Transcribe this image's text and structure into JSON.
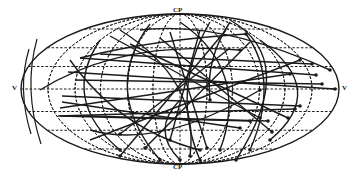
{
  "diagram": {
    "type": "all-sky equal-area projection (Aitoff/Hammer) with trajectory tracks",
    "labels": {
      "top_pole": "CP",
      "bottom_pole": "CP",
      "left_edge": "V",
      "right_edge": "V"
    },
    "geometry": {
      "cx": 180,
      "cy": 89,
      "rx": 159,
      "ry": 75
    },
    "colors": {
      "ink": "#1a1a1a",
      "background": "#ffffff"
    },
    "grid": {
      "meridian_fractions": [
        -0.83,
        -0.66,
        -0.5,
        -0.33,
        -0.17,
        0.17,
        0.33,
        0.5,
        0.66,
        0.83
      ],
      "parallel_fractions": [
        -0.8,
        -0.55,
        -0.3,
        0.3,
        0.55,
        0.8
      ]
    },
    "tracks": [
      {
        "type": "line",
        "pts": [
          [
            62,
            102
          ],
          [
            240,
            128
          ]
        ],
        "end": [
          240,
          128
        ]
      },
      {
        "type": "line",
        "pts": [
          [
            62,
            96
          ],
          [
            300,
            106
          ]
        ],
        "end": [
          300,
          106
        ]
      },
      {
        "type": "line",
        "pts": [
          [
            68,
            72
          ],
          [
            335,
            89
          ]
        ],
        "end": [
          335,
          89
        ]
      },
      {
        "type": "line",
        "pts": [
          [
            60,
            108
          ],
          [
            290,
            74
          ]
        ],
        "end": [
          290,
          74
        ]
      },
      {
        "type": "line",
        "pts": [
          [
            80,
            58
          ],
          [
            316,
            75
          ]
        ],
        "end": [
          316,
          75
        ]
      },
      {
        "type": "line",
        "pts": [
          [
            58,
            116
          ],
          [
            295,
            109
          ]
        ],
        "end": [
          295,
          109
        ]
      },
      {
        "type": "line",
        "pts": [
          [
            86,
            116
          ],
          [
            268,
            121
          ]
        ],
        "end": [
          268,
          121
        ]
      },
      {
        "type": "line",
        "pts": [
          [
            75,
            80
          ],
          [
            322,
            84
          ]
        ],
        "end": [
          322,
          84
        ]
      },
      {
        "type": "line",
        "pts": [
          [
            60,
            116
          ],
          [
            250,
            121
          ]
        ],
        "end": [
          250,
          121
        ]
      },
      {
        "type": "line",
        "pts": [
          [
            100,
            54
          ],
          [
            312,
            64
          ]
        ],
        "end": [
          312,
          64
        ]
      },
      {
        "type": "line",
        "pts": [
          [
            110,
            36
          ],
          [
            260,
            118
          ]
        ],
        "end": [
          260,
          118
        ]
      },
      {
        "type": "line",
        "pts": [
          [
            130,
            44
          ],
          [
            288,
            118
          ]
        ],
        "end": [
          288,
          118
        ]
      },
      {
        "type": "line",
        "pts": [
          [
            226,
            30
          ],
          [
            120,
            156
          ]
        ],
        "end": [
          120,
          156
        ]
      },
      {
        "type": "line",
        "pts": [
          [
            250,
            42
          ],
          [
            145,
            148
          ]
        ],
        "end": [
          145,
          148
        ]
      },
      {
        "type": "line",
        "pts": [
          [
            230,
            48
          ],
          [
            120,
            134
          ]
        ],
        "end": [
          120,
          134
        ]
      },
      {
        "type": "line",
        "pts": [
          [
            160,
            38
          ],
          [
            272,
            132
          ]
        ],
        "end": [
          272,
          132
        ]
      },
      {
        "type": "line",
        "pts": [
          [
            90,
            140
          ],
          [
            300,
            60
          ]
        ],
        "end": [
          300,
          60
        ]
      },
      {
        "type": "line",
        "pts": [
          [
            170,
            32
          ],
          [
            207,
            148
          ]
        ],
        "end": [
          207,
          148
        ]
      },
      {
        "type": "line",
        "pts": [
          [
            200,
            30
          ],
          [
            170,
            140
          ]
        ],
        "end": [
          170,
          140
        ]
      },
      {
        "type": "curve",
        "d": "M80 58 Q150 40 246 34",
        "end": [
          246,
          34
        ]
      },
      {
        "type": "curve",
        "d": "M246 34 Q280 80 250 150",
        "end": [
          250,
          150
        ]
      },
      {
        "type": "curve",
        "d": "M210 22 Q170 90 200 160",
        "end": [
          200,
          160
        ]
      },
      {
        "type": "curve",
        "d": "M150 24 Q100 90 160 160",
        "end": [
          160,
          160
        ]
      },
      {
        "type": "curve",
        "d": "M230 20 Q300 60 236 160",
        "end": [
          236,
          160
        ]
      },
      {
        "type": "curve",
        "d": "M120 30 Q200 80 190 156",
        "end": [
          190,
          156
        ]
      },
      {
        "type": "curve",
        "d": "M70 60 Q120 130 200 150",
        "end": [
          200,
          150
        ]
      },
      {
        "type": "curve",
        "d": "M100 40 Q60 100 120 150",
        "end": [
          120,
          150
        ]
      },
      {
        "type": "curve",
        "d": "M260 40 Q330 90 270 140",
        "end": [
          270,
          140
        ]
      },
      {
        "type": "curve",
        "d": "M180 22 Q250 70 220 150",
        "end": [
          220,
          150
        ]
      },
      {
        "type": "curve",
        "d": "M140 30 Q220 20 330 70",
        "end": [
          330,
          70
        ]
      },
      {
        "type": "curve",
        "d": "M40 90 Q120 40 240 50",
        "end": [
          240,
          50
        ]
      },
      {
        "type": "curve",
        "d": "M90 130 Q160 150 260 90",
        "end": [
          260,
          90
        ]
      },
      {
        "type": "curve",
        "d": "M230 22 Q205 60 210 100",
        "end": [
          210,
          100
        ]
      },
      {
        "type": "curve",
        "d": "M180 100 Q150 130 180 160",
        "end": [
          180,
          160
        ]
      }
    ]
  }
}
